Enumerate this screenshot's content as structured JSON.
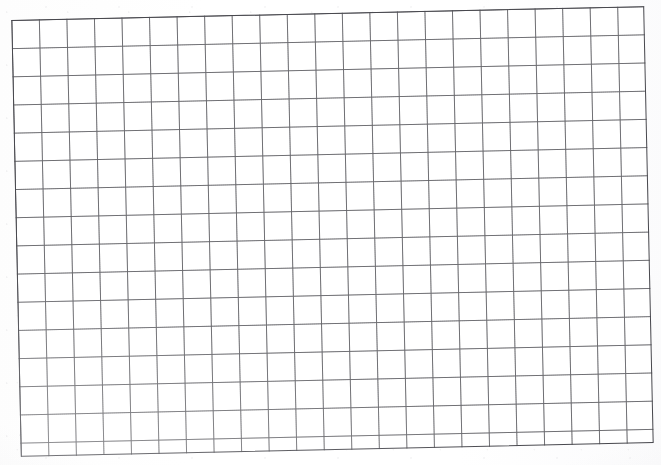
{
  "document": {
    "kind": "scanned-grid-paper",
    "title": "Scanned sheet of blank grid paper",
    "description": "A photocopied / scanned page of blank square grid (graph) paper. The ruled block is slightly rotated counter-clockwise relative to the page edges. No handwriting, text, labels or marks are present.",
    "surface_color": "#ffffff",
    "has_text_content": "no"
  },
  "grid": {
    "name": "grid-paper-ruling",
    "columns": 23,
    "rows": 15,
    "cell_width_px": 27.55,
    "cell_height_px": 28.2,
    "line_color": "#60606 4",
    "line_color_hex": "#606064",
    "border_color_hex": "#48484e",
    "line_width_px": 1.1,
    "border_width_px": 1.4,
    "rotation_deg": -1.25,
    "block_left_px": 16,
    "block_top_px": 13,
    "block_width_px": 633,
    "block_height_px": 437
  },
  "page": {
    "width_px": 661,
    "height_px": 465,
    "background_hex": "#ffffff",
    "margin_note": "blank unruled margin on all four sides"
  },
  "annotations": {
    "marks": [],
    "labels": [],
    "count": 0
  }
}
